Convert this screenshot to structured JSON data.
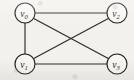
{
  "figure": {
    "kind": "undirected-graph-diagram",
    "width": 134,
    "height": 80,
    "background_color": "#f2f1ed",
    "stroke_color": "#2b2a28",
    "node_fill_color": "#f7f6f3",
    "node_radius": 10
  },
  "nodes": [
    {
      "id": "v0",
      "base": "v",
      "subscript": "0",
      "label": "v0",
      "cx": 25,
      "cy": 13
    },
    {
      "id": "v2",
      "base": "v",
      "subscript": "2",
      "label": "v2",
      "cx": 117,
      "cy": 13
    },
    {
      "id": "v1",
      "base": "v",
      "subscript": "1",
      "label": "v1",
      "cx": 25,
      "cy": 64
    },
    {
      "id": "v3",
      "base": "v",
      "subscript": "3",
      "label": "v3",
      "cx": 117,
      "cy": 64
    }
  ],
  "edges": [
    {
      "id": "e-v0-v2",
      "from": "v0",
      "to": "v2",
      "kind": "top-horizontal",
      "x1": 35,
      "y1": 13,
      "x2": 107,
      "y2": 13
    },
    {
      "id": "e-v0-v1",
      "from": "v0",
      "to": "v1",
      "kind": "left-vertical",
      "x1": 25,
      "y1": 23,
      "x2": 25,
      "y2": 54
    },
    {
      "id": "e-v1-v3",
      "from": "v1",
      "to": "v3",
      "kind": "bottom-horizontal",
      "x1": 35,
      "y1": 64,
      "x2": 107,
      "y2": 64
    },
    {
      "id": "e-v0-v3",
      "from": "v0",
      "to": "v3",
      "kind": "diagonal-down-right",
      "x1": 33.7,
      "y1": 18.4,
      "x2": 108.3,
      "y2": 58.6
    },
    {
      "id": "e-v1-v2",
      "from": "v1",
      "to": "v2",
      "kind": "diagonal-up-right",
      "x1": 33.7,
      "y1": 58.6,
      "x2": 108.3,
      "y2": 18.4
    }
  ],
  "crossing_point": {
    "x": 71,
    "y": 38.5
  }
}
